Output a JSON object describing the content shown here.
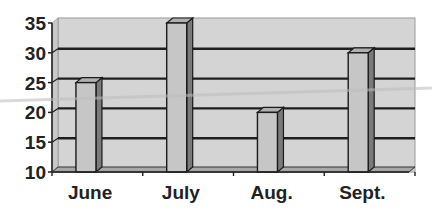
{
  "chart_data": {
    "type": "bar",
    "style": "3d-column",
    "title": "",
    "xlabel": "",
    "ylabel": "",
    "categories": [
      "June",
      "July",
      "Aug.",
      "Sept."
    ],
    "values": [
      25,
      35,
      20,
      30
    ],
    "ylim": [
      10,
      35
    ],
    "yticks": [
      10,
      15,
      20,
      25,
      30,
      35
    ],
    "grid": true,
    "legend": null
  },
  "colors": {
    "wall": "#d4d4d4",
    "floor": "#a8a8a8",
    "bar_front": "#c6c6c6",
    "bar_side": "#7a7a7a",
    "bar_top": "#b0b0b0",
    "gridline": "#1e1e1e",
    "axis": "#222222",
    "artifact_line": "#bdbdbd"
  }
}
